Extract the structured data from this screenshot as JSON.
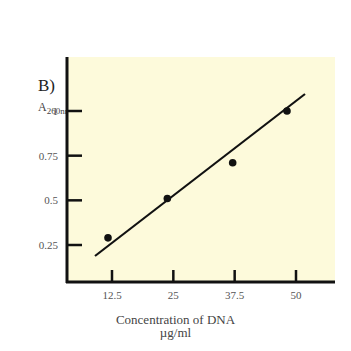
{
  "panel_label": "B)",
  "y_axis": {
    "label_main": "A",
    "label_sub": "260nm"
  },
  "x_axis": {
    "title_line1": "Concentration of DNA",
    "title_line2": "µg/ml"
  },
  "colors": {
    "plot_bg": "#fdfadb",
    "axis": "#111111",
    "text": "#444444"
  },
  "chart_data": {
    "type": "scatter",
    "title": "",
    "xlabel": "Concentration of DNA µg/ml",
    "ylabel": "A260nm",
    "x_ticks": [
      "12.5",
      "25",
      "37.5",
      "50"
    ],
    "y_ticks": [
      "0.25",
      "0.5",
      "0.75",
      "1"
    ],
    "x": [
      12.5,
      25,
      37.5,
      50
    ],
    "y": [
      0.29,
      0.51,
      0.71,
      1.0
    ],
    "fit_line": {
      "x": [
        10,
        52
      ],
      "y": [
        0.19,
        1.05
      ]
    },
    "xlim": [
      0,
      55
    ],
    "ylim": [
      0.05,
      1.2
    ],
    "grid": false,
    "legend": null
  }
}
